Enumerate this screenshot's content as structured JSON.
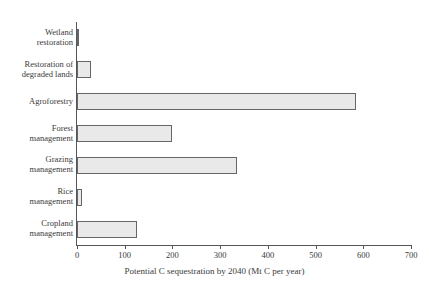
{
  "chart_data": {
    "type": "bar",
    "orientation": "horizontal",
    "title": "",
    "xlabel": "Potential C sequestration by 2040 (Mt C per year)",
    "ylabel": "",
    "categories": [
      "Wetland restoration",
      "Restoration of degraded lands",
      "Agroforestry",
      "Forest management",
      "Grazing management",
      "Rice management",
      "Cropland management"
    ],
    "category_lines": [
      [
        "Wetland",
        "restoration"
      ],
      [
        "Restoration of",
        "degraded lands"
      ],
      [
        "Agroforestry"
      ],
      [
        "Forest",
        "management"
      ],
      [
        "Grazing",
        "management"
      ],
      [
        "Rice",
        "management"
      ],
      [
        "Cropland",
        "management"
      ]
    ],
    "values": [
      5,
      30,
      585,
      200,
      335,
      10,
      125
    ],
    "xlim": [
      0,
      700
    ],
    "xticks": [
      0,
      100,
      200,
      300,
      400,
      500,
      600,
      700
    ],
    "xtick_labels": [
      "0",
      "100",
      "200",
      "300",
      "400",
      "500",
      "600",
      "700"
    ],
    "grid": false,
    "legend": false,
    "bar_fill_color": "#e9e9e9",
    "bar_border_color": "#666666",
    "axis_color": "#555555",
    "text_color": "#3a3a3a",
    "background_color": "#ffffff"
  }
}
